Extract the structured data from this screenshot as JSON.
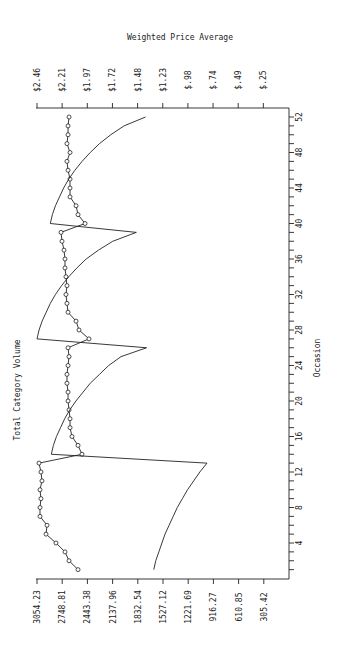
{
  "chart_data": {
    "type": "line",
    "orientation": "rotated-90",
    "title": "Weighted Price Average",
    "xlabel": "Occasion",
    "ylabel": "Total Category Volume",
    "y2label": "Weighted Price Average",
    "x": [
      1,
      2,
      3,
      4,
      5,
      6,
      7,
      8,
      9,
      10,
      11,
      12,
      13,
      14,
      15,
      16,
      17,
      18,
      19,
      20,
      21,
      22,
      23,
      24,
      25,
      26,
      27,
      28,
      29,
      30,
      31,
      32,
      33,
      34,
      35,
      36,
      37,
      38,
      39,
      40,
      41,
      42,
      43,
      44,
      45,
      46,
      47,
      48,
      49,
      50,
      51,
      52
    ],
    "x_ticks": [
      4,
      8,
      12,
      16,
      20,
      24,
      28,
      32,
      36,
      40,
      44,
      48,
      52
    ],
    "xlim": [
      0,
      53
    ],
    "volume_ticks": [
      "3054.23",
      "2748.81",
      "2443.38",
      "2137.96",
      "1832.54",
      "1527.12",
      "1221.69",
      "916.27",
      "610.85",
      "305.42"
    ],
    "volume_lim": [
      0,
      3054.23
    ],
    "price_ticks": [
      "$2.46",
      "$2.21",
      "$1.97",
      "$1.72",
      "$1.48",
      "$1.23",
      "$.98",
      "$.74",
      "$.49",
      "$.25"
    ],
    "price_lim": [
      0,
      2.46
    ],
    "series": [
      {
        "name": "Total Category Volume",
        "axis": "volume",
        "marker": "circle",
        "values": [
          2557,
          2666,
          2715,
          2824,
          2945,
          2933,
          3018,
          3018,
          3006,
          3018,
          2994,
          3006,
          3030,
          2509,
          2557,
          2630,
          2654,
          2654,
          2666,
          2678,
          2678,
          2691,
          2691,
          2678,
          2666,
          2678,
          2424,
          2545,
          2581,
          2678,
          2691,
          2703,
          2691,
          2703,
          2715,
          2715,
          2727,
          2751,
          2763,
          2472,
          2557,
          2581,
          2654,
          2654,
          2654,
          2678,
          2691,
          2654,
          2691,
          2678,
          2678,
          2666
        ]
      },
      {
        "name": "Weighted Price Average",
        "axis": "price",
        "marker": "none",
        "values": [
          1.32,
          1.3,
          1.27,
          1.24,
          1.21,
          1.17,
          1.13,
          1.09,
          1.04,
          0.99,
          0.93,
          0.87,
          0.8,
          2.32,
          2.3,
          2.27,
          2.23,
          2.19,
          2.14,
          2.08,
          2.01,
          1.94,
          1.85,
          1.76,
          1.64,
          1.39,
          2.46,
          2.44,
          2.41,
          2.37,
          2.33,
          2.28,
          2.22,
          2.15,
          2.07,
          1.98,
          1.86,
          1.72,
          1.49,
          2.33,
          2.31,
          2.28,
          2.24,
          2.2,
          2.15,
          2.09,
          2.02,
          1.94,
          1.85,
          1.74,
          1.61,
          1.4
        ]
      }
    ],
    "grid": false,
    "legend": "none"
  }
}
